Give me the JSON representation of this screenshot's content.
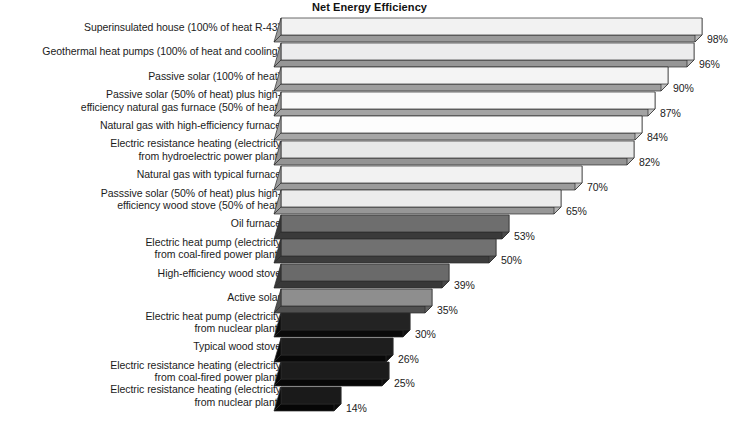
{
  "chart_data": {
    "type": "bar",
    "orientation": "horizontal",
    "title": "Net Energy Efficiency",
    "xlabel": "",
    "ylabel": "",
    "xlim": [
      0,
      100
    ],
    "grid": false,
    "legend": null,
    "value_suffix": "%",
    "categories": [
      "Superinsulated house (100% of heat R-43)",
      "Geothermal heat pumps (100% of heat and cooling)",
      "Passive solar (100% of heat)",
      "Passive solar (50% of heat) plus high-\nefficiency natural gas furnace (50% of heat)",
      "Natural gas with high-efficiency furnace",
      "Electric resistance heating (electricity\nfrom hydroelectric power plant)",
      "Natural gas with typical furnace",
      "Passsive solar (50% of heat) plus high-\nefficiency wood stove (50% of heat)",
      "Oil furnace",
      "Electric heat pump (electricity\nfrom coal-fired power plant)",
      "High-efficiency wood stove",
      "Active solar",
      "Electric heat pump (electricity\nfrom nuclear plant)",
      "Typical wood stove",
      "Electric resistance heating (electricity\nfrom coal-fired power plant)",
      "Electric resistance heating (electricity\nfrom nuclear plant)"
    ],
    "values": [
      98,
      96,
      90,
      87,
      84,
      82,
      70,
      65,
      53,
      50,
      39,
      35,
      30,
      26,
      25,
      14
    ],
    "value_labels": [
      "98%",
      "96%",
      "90%",
      "87%",
      "84%",
      "82%",
      "70%",
      "65%",
      "53%",
      "50%",
      "39%",
      "35%",
      "30%",
      "26%",
      "25%",
      "14%"
    ],
    "bar_colors": [
      "#f2f2f2",
      "#ececed",
      "#f4f4f4",
      "#fafafa",
      "#fdfdfd",
      "#e8e9e9",
      "#f2f2f2",
      "#ececec",
      "#6e6e6e",
      "#717171",
      "#6a6a6a",
      "#8e8e8e",
      "#232323",
      "#1e1e1e",
      "#1c1c1c",
      "#1a1a1a"
    ],
    "bar_side_colors": [
      "#b9b9b9",
      "#b3b3b3",
      "#bdbdbd",
      "#c3c3c3",
      "#c6c6c6",
      "#b0b0b0",
      "#bababa",
      "#b4b4b4",
      "#4a4a4a",
      "#4d4d4d",
      "#474747",
      "#626262",
      "#121212",
      "#0f0f0f",
      "#0d0d0d",
      "#0c0c0c"
    ],
    "bar_top_colors": [
      "#9a9a9a",
      "#969696",
      "#9e9e9e",
      "#a3a3a3",
      "#a6a6a6",
      "#949494",
      "#9b9b9b",
      "#979797",
      "#3a3a3a",
      "#3c3c3c",
      "#383838",
      "#505050",
      "#0a0a0a",
      "#080808",
      "#070707",
      "#060606"
    ]
  },
  "layout": {
    "bar_origin_x": 281,
    "bar_unit_px": 4.3,
    "row_pitch": 24.6,
    "first_row_top": 18,
    "bar_height": 17,
    "depth": 7
  }
}
